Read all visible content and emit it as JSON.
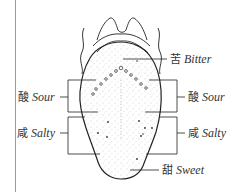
{
  "diagram": {
    "title": "",
    "labels": {
      "bitter": {
        "cn": "苦",
        "en": "Bitter"
      },
      "sour_left": {
        "cn": "酸",
        "en": "Sour"
      },
      "sour_right": {
        "cn": "酸",
        "en": "Sour"
      },
      "salty_left": {
        "cn": "咸",
        "en": "Salty"
      },
      "salty_right": {
        "cn": "咸",
        "en": "Salty"
      },
      "sweet": {
        "cn": "甜",
        "en": "Sweet"
      }
    },
    "colors": {
      "outline": "#222222",
      "stipple": "#9a9a9a",
      "margin_line": "#9a9a9a",
      "text": "#333333"
    }
  }
}
